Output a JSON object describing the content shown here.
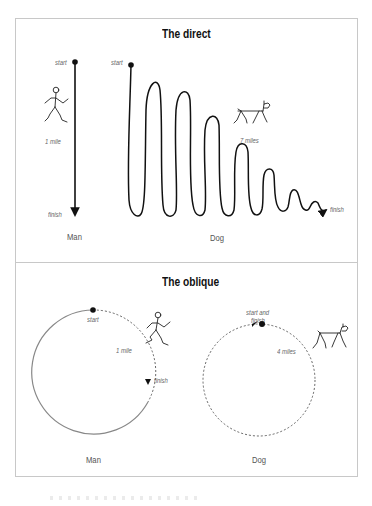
{
  "panels": {
    "direct": {
      "title": "The direct",
      "man": {
        "start_label": "start",
        "distance_label": "1 mile",
        "finish_label": "finish",
        "caption": "Man"
      },
      "dog": {
        "start_label": "start",
        "distance_label": "7 miles",
        "finish_label": "finish",
        "caption": "Dog"
      }
    },
    "oblique": {
      "title": "The oblique",
      "man": {
        "start_label": "start",
        "distance_label": "1 mile",
        "finish_label": "finish",
        "caption": "Man"
      },
      "dog": {
        "start_label_line1": "start and",
        "start_label_line2": "finish",
        "distance_label": "4 miles",
        "caption": "Dog"
      }
    }
  },
  "colors": {
    "line": "#111111",
    "circle_solid": "#888888",
    "circle_dashed": "#555555",
    "border": "#c8c8c8",
    "label": "#666666"
  }
}
